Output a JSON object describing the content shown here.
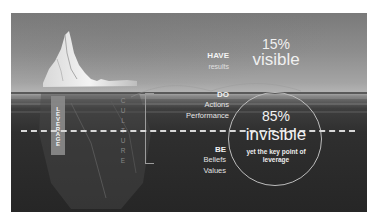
{
  "slide": {
    "top_layer": {
      "title": "HAVE",
      "subtitle": "results",
      "percent": "15%",
      "label": "visible"
    },
    "middle_layer": {
      "title": "DO",
      "items": [
        "Actions",
        "Performance"
      ]
    },
    "bottom_layer": {
      "title": "BE",
      "items": [
        "Beliefs",
        "Values"
      ],
      "percent": "85%",
      "label": "invisible",
      "note": "yet the key point of leverage"
    },
    "vertical_labels": {
      "leverage": "LEVERAGE",
      "culture": "CULTURE"
    },
    "colors": {
      "sky": "#9a9a9a",
      "water": "#2a2a2a",
      "text": "#f2f2f2",
      "leverage_bar": "#8a8a8a",
      "dashed_line": "#d8d8d8"
    }
  }
}
